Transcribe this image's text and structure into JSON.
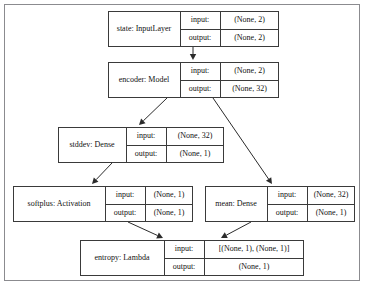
{
  "diagram": {
    "frame": {
      "stroke_color": "#8b8b8f"
    },
    "node_style": {
      "stroke_color": "#3a3a3a",
      "fill_color": "#ffffff",
      "text_color": "#111111"
    },
    "edge_style": {
      "stroke_color": "#2b2b2b"
    },
    "row_labels": {
      "input": "input:",
      "output": "output:"
    },
    "nodes": [
      {
        "id": "state",
        "name": "state: InputLayer",
        "input_label": "input:",
        "output_label": "output:",
        "input_value": "(None, 2)",
        "output_value": "(None, 2)",
        "x": 108,
        "y": 11,
        "w": 171,
        "h": 36,
        "name_w": 72,
        "label_w": 40
      },
      {
        "id": "encoder",
        "name": "encoder: Model",
        "input_label": "input:",
        "output_label": "output:",
        "input_value": "(None, 2)",
        "output_value": "(None, 32)",
        "x": 108,
        "y": 62,
        "w": 171,
        "h": 36,
        "name_w": 72,
        "label_w": 40
      },
      {
        "id": "stddev",
        "name": "stddev: Dense",
        "input_label": "input:",
        "output_label": "output:",
        "input_value": "(None, 32)",
        "output_value": "(None, 1)",
        "x": 58,
        "y": 127,
        "w": 166,
        "h": 36,
        "name_w": 68,
        "label_w": 40
      },
      {
        "id": "softplus",
        "name": "softplus: Activation",
        "input_label": "input:",
        "output_label": "output:",
        "input_value": "(None, 1)",
        "output_value": "(None, 1)",
        "x": 13,
        "y": 186,
        "w": 180,
        "h": 36,
        "name_w": 92,
        "label_w": 40
      },
      {
        "id": "mean",
        "name": "mean: Dense",
        "input_label": "input:",
        "output_label": "output:",
        "input_value": "(None, 32)",
        "output_value": "(None, 1)",
        "x": 205,
        "y": 186,
        "w": 150,
        "h": 36,
        "name_w": 62,
        "label_w": 40
      },
      {
        "id": "entropy",
        "name": "entropy: Lambda",
        "input_label": "input:",
        "output_label": "output:",
        "input_value": "[(None, 1), (None, 1)]",
        "output_value": "(None, 1)",
        "x": 80,
        "y": 240,
        "w": 224,
        "h": 36,
        "name_w": 84,
        "label_w": 40
      }
    ],
    "edges": [
      {
        "from": "state",
        "to": "encoder",
        "x1": 193,
        "y1": 47,
        "x2": 193,
        "y2": 60
      },
      {
        "from": "encoder",
        "to": "stddev",
        "x1": 167,
        "y1": 98,
        "x2": 139,
        "y2": 125
      },
      {
        "from": "encoder",
        "to": "mean",
        "x1": 213,
        "y1": 98,
        "x2": 272,
        "y2": 184
      },
      {
        "from": "stddev",
        "to": "softplus",
        "x1": 112,
        "y1": 163,
        "x2": 92,
        "y2": 184
      },
      {
        "from": "softplus",
        "to": "entropy",
        "x1": 128,
        "y1": 222,
        "x2": 163,
        "y2": 238
      },
      {
        "from": "mean",
        "to": "entropy",
        "x1": 251,
        "y1": 222,
        "x2": 221,
        "y2": 238
      }
    ]
  }
}
